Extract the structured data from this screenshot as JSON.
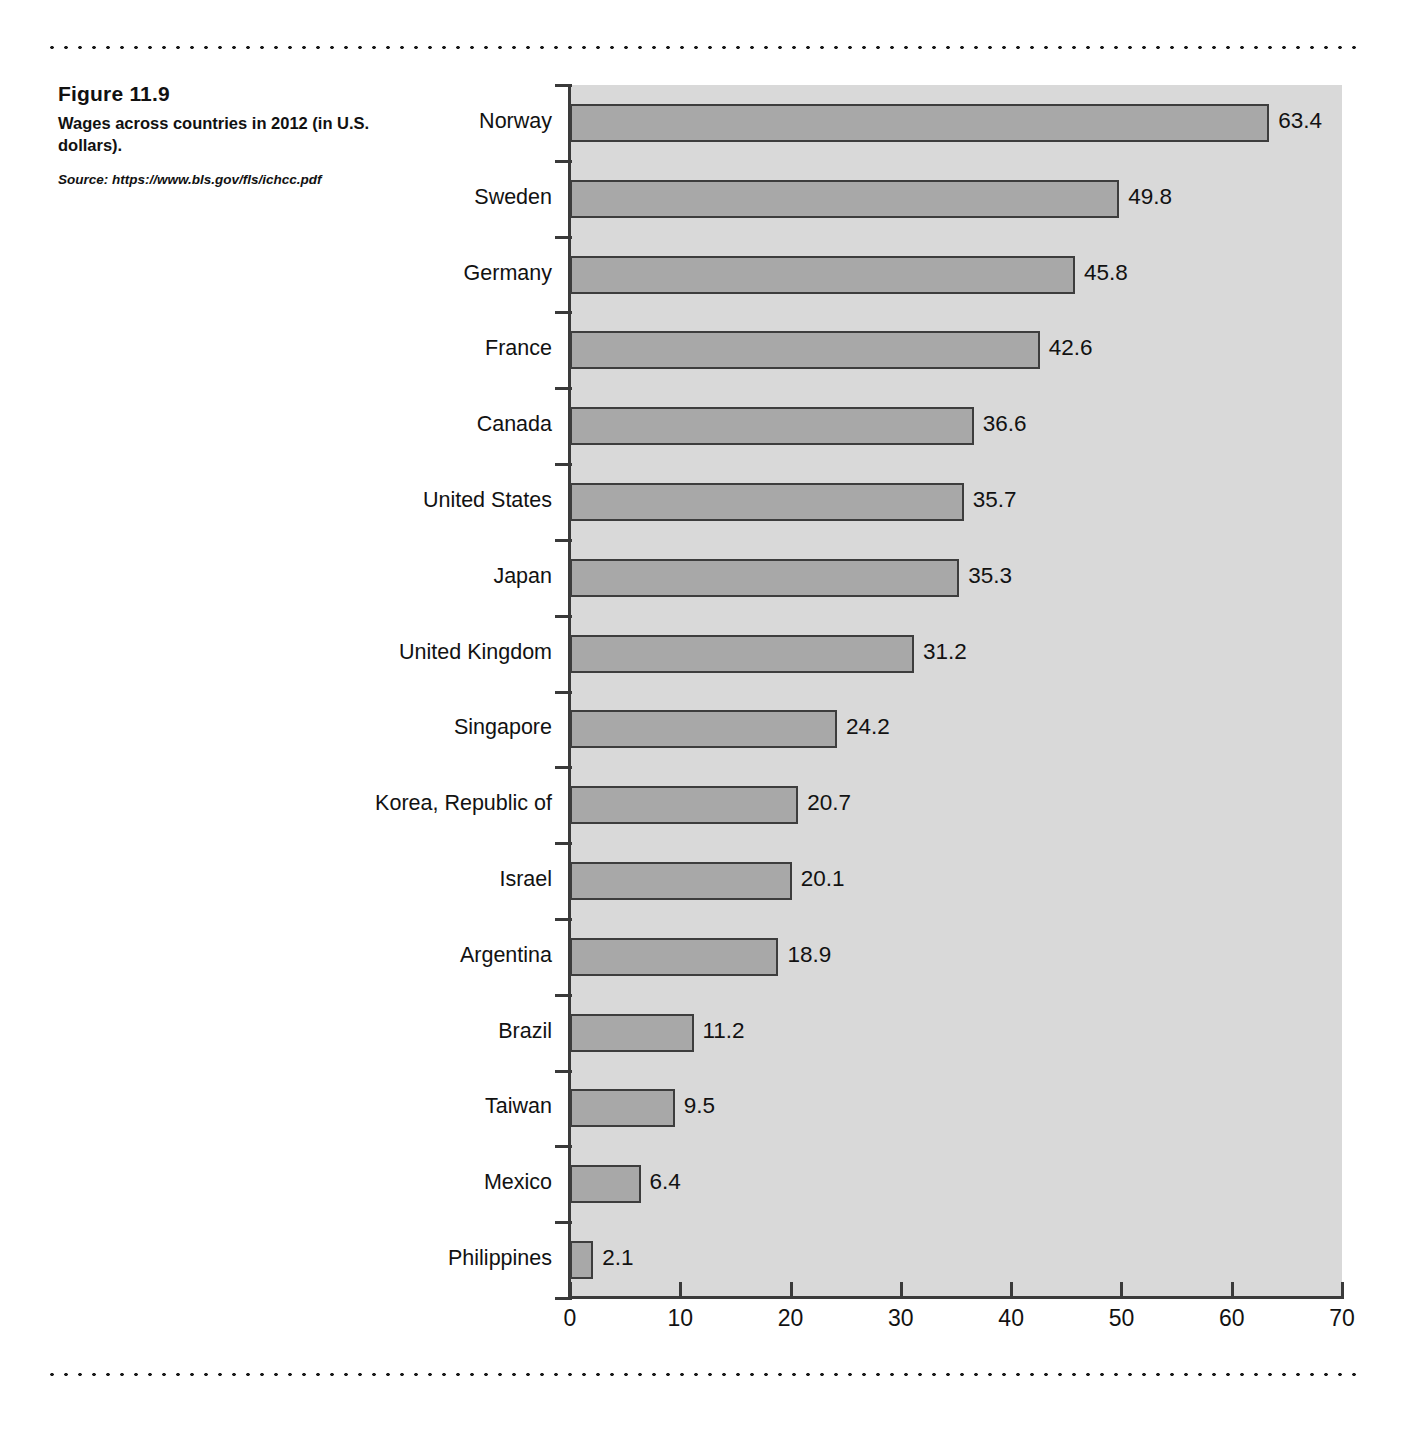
{
  "figure": {
    "number": "Figure 11.9",
    "description": "Wages across countries in 2012 (in U.S. dollars).",
    "source": "Source: https://www.bls.gov/fls/ichcc.pdf"
  },
  "colors": {
    "bar_fill": "#a8a8a8",
    "bar_stroke": "#3d3d3d",
    "plot_background": "#d9d9d9",
    "axis": "#3a3a3a",
    "text": "#121212"
  },
  "chart_data": {
    "type": "bar",
    "orientation": "horizontal",
    "title": "Wages across countries in 2012 (in U.S. dollars).",
    "xlabel": "",
    "ylabel": "",
    "xlim": [
      0,
      70
    ],
    "xticks": [
      0,
      10,
      20,
      30,
      40,
      50,
      60,
      70
    ],
    "xtick_labels": [
      "0",
      "10",
      "20",
      "30",
      "40",
      "50",
      "60",
      "70"
    ],
    "grid": false,
    "legend": false,
    "data_labels": true,
    "categories": [
      "Norway",
      "Sweden",
      "Germany",
      "France",
      "Canada",
      "United States",
      "Japan",
      "United Kingdom",
      "Singapore",
      "Korea, Republic of",
      "Israel",
      "Argentina",
      "Brazil",
      "Taiwan",
      "Mexico",
      "Philippines"
    ],
    "values": [
      63.4,
      49.8,
      45.8,
      42.6,
      36.6,
      35.7,
      35.3,
      31.2,
      24.2,
      20.7,
      20.1,
      18.9,
      11.2,
      9.5,
      6.4,
      2.1
    ],
    "value_labels": [
      "63.4",
      "49.8",
      "45.8",
      "42.6",
      "36.6",
      "35.7",
      "35.3",
      "31.2",
      "24.2",
      "20.7",
      "20.1",
      "18.9",
      "11.2",
      "9.5",
      "6.4",
      "2.1"
    ]
  }
}
